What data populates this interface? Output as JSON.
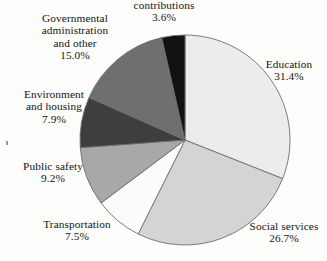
{
  "chart_data": {
    "type": "pie",
    "title": "",
    "subtitle": "",
    "xlabel": "",
    "ylabel": "",
    "legend_position": "none",
    "grid": false,
    "units": "percent",
    "start_angle_deg": 0,
    "direction": "clockwise",
    "center": {
      "x": 185,
      "y": 140
    },
    "radius": 105,
    "categories": [
      "Education",
      "Social services",
      "Transportation",
      "Public safety",
      "Environment and housing",
      "Governmental administration and other",
      "contributions"
    ],
    "values": [
      31.4,
      26.7,
      7.5,
      9.2,
      7.9,
      15.0,
      3.6
    ],
    "slices": [
      {
        "name": "Education",
        "value": 31.4,
        "value_label": "31.4%",
        "label_line1": "Education",
        "label_line2": "31.4%",
        "color": "#ececea",
        "stroke": "#6e6e6e"
      },
      {
        "name": "Social services",
        "value": 26.7,
        "value_label": "26.7%",
        "label_line1": "Social services",
        "label_line2": "26.7%",
        "color": "#d4d4d2",
        "stroke": "#6e6e6e"
      },
      {
        "name": "Transportation",
        "value": 7.5,
        "value_label": "7.5%",
        "label_line1": "Transportation",
        "label_line2": "7.5%",
        "color": "#fcfcfb",
        "stroke": "#6e6e6e"
      },
      {
        "name": "Public safety",
        "value": 9.2,
        "value_label": "9.2%",
        "label_line1": "Public safety",
        "label_line2": "9.2%",
        "color": "#a8a8a6",
        "stroke": "#6e6e6e"
      },
      {
        "name": "Environment and housing",
        "value": 7.9,
        "value_label": "7.9%",
        "label_line1": "Environment",
        "label_line2": "and housing",
        "label_line3": "7.9%",
        "color": "#3e3e3e",
        "stroke": "#6e6e6e"
      },
      {
        "name": "Governmental administration and other",
        "value": 15.0,
        "value_label": "15.0%",
        "label_line1": "Governmental",
        "label_line2": "administration",
        "label_line3": "and other",
        "label_line4": "15.0%",
        "color": "#6f6f6f",
        "stroke": "#6e6e6e"
      },
      {
        "name": "contributions",
        "value": 3.6,
        "value_label": "3.6%",
        "label_line1": "contributions",
        "label_line2": "3.6%",
        "color": "#121212",
        "stroke": "#6e6e6e"
      }
    ]
  },
  "labels": {
    "contributions": {
      "name": "contributions",
      "pct": "3.6%"
    },
    "governmental": {
      "line1": "Governmental",
      "line2": "administration",
      "line3": "and other",
      "pct": "15.0%"
    },
    "environment": {
      "line1": "Environment",
      "line2": "and housing",
      "pct": "7.9%"
    },
    "public_safety": {
      "name": "Public safety",
      "pct": "9.2%"
    },
    "transportation": {
      "name": "Transportation",
      "pct": "7.5%"
    },
    "education": {
      "name": "Education",
      "pct": "31.4%"
    },
    "social_services": {
      "name": "Social services",
      "pct": "26.7%"
    }
  },
  "colors": {
    "background": "#fdfdfc",
    "outline": "#6e6e6e",
    "text": "#141414"
  }
}
